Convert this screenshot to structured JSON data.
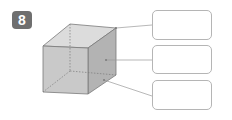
{
  "exercise": {
    "number": "8"
  },
  "figure": {
    "shape": "rectangular prism",
    "labels": [
      "",
      "",
      ""
    ]
  },
  "colors": {
    "badge": "#6f6f6f",
    "front_face": "#c9c9c9",
    "top_face": "#dcdcdc",
    "right_face": "#b3b3b3",
    "edge": "#7a7a7a",
    "box_border": "#b5b5b5"
  }
}
